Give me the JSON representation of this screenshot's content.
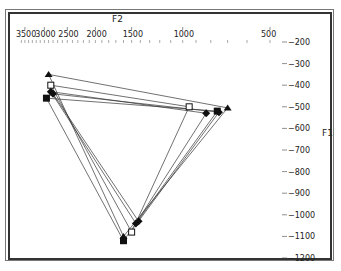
{
  "chart_data": {
    "type": "scatter",
    "title": "",
    "xlabel": "F2",
    "ylabel": "F1",
    "x_scale": "log-reversed",
    "y_axis_position": "right",
    "x_axis_position": "top",
    "x_ticks": [
      3500,
      3000,
      2500,
      2000,
      1500,
      1000,
      500
    ],
    "y_ticks": [
      -200,
      -300,
      -400,
      -500,
      -600,
      -700,
      -800,
      -900,
      -1000,
      -1100,
      -1200
    ],
    "xlim": [
      3600,
      380
    ],
    "ylim": [
      -200,
      -1200
    ],
    "grid": false,
    "legend": null,
    "series": [
      {
        "name": "triangle",
        "marker": "triangle-filled",
        "points": [
          {
            "F2": 2900,
            "F1": -350
          },
          {
            "F2": 700,
            "F1": -505
          },
          {
            "F2": 1600,
            "F1": -1100
          }
        ]
      },
      {
        "name": "open-square",
        "marker": "square-open",
        "points": [
          {
            "F2": 2850,
            "F1": -400
          },
          {
            "F2": 950,
            "F1": -500
          },
          {
            "F2": 1500,
            "F1": -1080
          }
        ]
      },
      {
        "name": "diamond-a",
        "marker": "diamond-filled",
        "points": [
          {
            "F2": 2850,
            "F1": -430
          },
          {
            "F2": 830,
            "F1": -530
          },
          {
            "F2": 1450,
            "F1": -1040
          }
        ]
      },
      {
        "name": "diamond-b",
        "marker": "diamond-filled",
        "points": [
          {
            "F2": 2800,
            "F1": -440
          },
          {
            "F2": 750,
            "F1": -525
          },
          {
            "F2": 1420,
            "F1": -1030
          }
        ]
      },
      {
        "name": "filled-square",
        "marker": "square-filled",
        "points": [
          {
            "F2": 2950,
            "F1": -460
          },
          {
            "F2": 760,
            "F1": -520
          },
          {
            "F2": 1600,
            "F1": -1120
          }
        ]
      }
    ]
  },
  "axes": {
    "x_title": "F2",
    "y_title": "F1",
    "x_tick_labels": [
      "3500",
      "3000",
      "2500",
      "2000",
      "1500",
      "1000",
      "500"
    ],
    "y_tick_labels": [
      "-200",
      "-300",
      "-400",
      "-500",
      "-600",
      "-700",
      "-800",
      "-900",
      "-1000",
      "-1100",
      "-1200"
    ]
  }
}
